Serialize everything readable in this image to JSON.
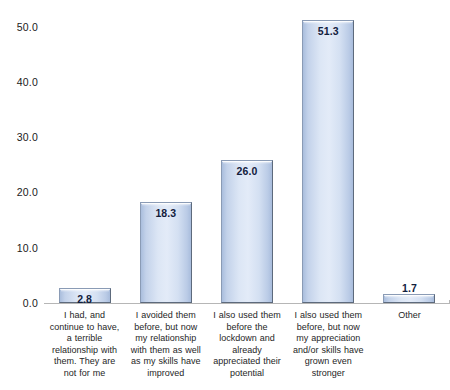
{
  "chart_data": {
    "type": "bar",
    "title": "",
    "subtitle": "",
    "xlabel": "",
    "ylabel": "",
    "ylim": [
      0,
      50
    ],
    "ytick_labels": [
      "50.0",
      "40.0",
      "30.0",
      "20.0",
      "10.0",
      "0.0"
    ],
    "ytick_values": [
      50,
      40,
      30,
      20,
      10,
      0
    ],
    "grid": false,
    "legend": false,
    "legend_position": "none",
    "orientation": "vertical",
    "categories": [
      "I had, and continue to have, a terrible relationship with them. They are not for me",
      "I avoided them before, but now my relationship with them as well as my skills have improved",
      "I also used them before the lockdown and already appreciated their potential",
      "I also used them before, but now my appreciation and/or skills have grown even stronger",
      "Other"
    ],
    "values": [
      2.8,
      18.3,
      26.0,
      51.3,
      1.7
    ],
    "value_labels": [
      "2.8",
      "18.3",
      "26.0",
      "51.3",
      "1.7"
    ],
    "bar_color": "#d5e1f2",
    "bar_border_color": "#8a9bb5",
    "axis_color": "#b6b6b6",
    "text_color": "#262626"
  }
}
